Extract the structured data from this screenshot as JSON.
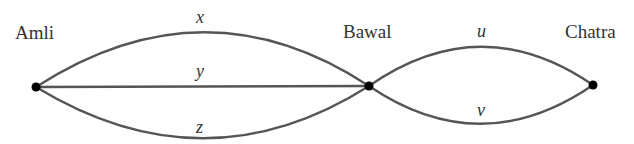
{
  "diagram": {
    "type": "multigraph",
    "nodes": [
      {
        "id": "amli",
        "label": "Amli"
      },
      {
        "id": "bawal",
        "label": "Bawal"
      },
      {
        "id": "chatra",
        "label": "Chatra"
      }
    ],
    "edges": [
      {
        "id": "x",
        "label": "x",
        "from": "Amli",
        "to": "Bawal",
        "shape": "upper arc"
      },
      {
        "id": "y",
        "label": "y",
        "from": "Amli",
        "to": "Bawal",
        "shape": "straight"
      },
      {
        "id": "z",
        "label": "z",
        "from": "Amli",
        "to": "Bawal",
        "shape": "lower arc"
      },
      {
        "id": "u",
        "label": "u",
        "from": "Bawal",
        "to": "Chatra",
        "shape": "upper arc"
      },
      {
        "id": "v",
        "label": "v",
        "from": "Bawal",
        "to": "Chatra",
        "shape": "lower arc"
      }
    ]
  },
  "colors": {
    "edge": "#555555",
    "node": "#000000",
    "text": "#333333",
    "background": "#ffffff"
  }
}
